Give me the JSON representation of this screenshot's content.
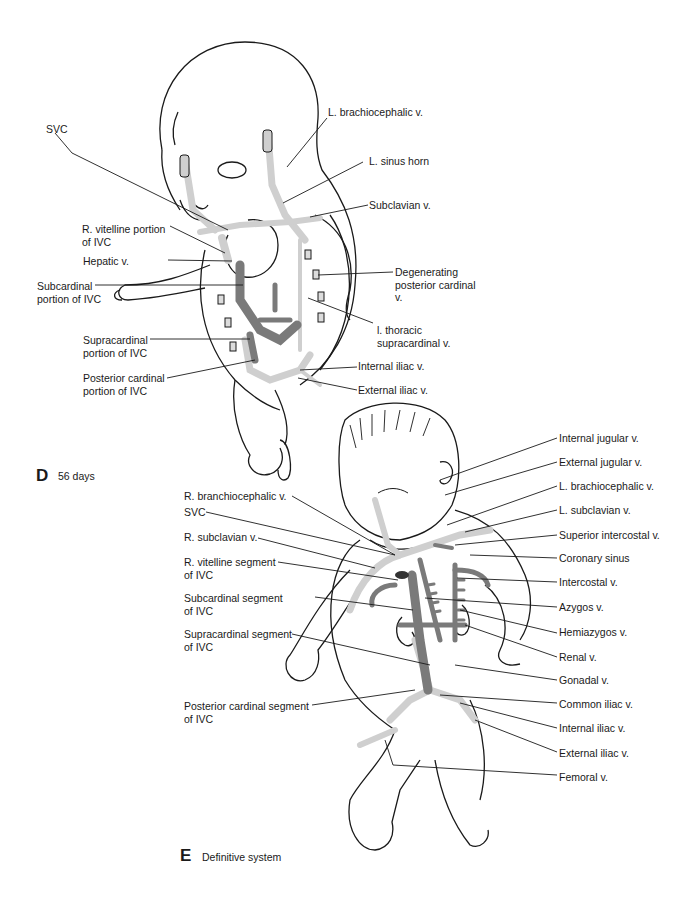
{
  "figure": {
    "panels": [
      {
        "id": "D",
        "letter": "D",
        "caption": "56 days",
        "labels_left": [
          {
            "text": "SVC"
          },
          {
            "text": "R. vitelline portion",
            "text2": "of IVC"
          },
          {
            "text": "Hepatic v."
          },
          {
            "text": "Subcardinal",
            "text2": "portion of IVC"
          },
          {
            "text": "Supracardinal",
            "text2": "portion of IVC"
          },
          {
            "text": "Posterior cardinal",
            "text2": "portion of IVC"
          }
        ],
        "labels_right": [
          {
            "text": "L. brachiocephalic v."
          },
          {
            "text": "L. sinus horn"
          },
          {
            "text": "Subclavian v."
          },
          {
            "text": "Degenerating",
            "text2": "posterior cardinal",
            "text3": "v."
          },
          {
            "text": "l. thoracic",
            "text2": "supracardinal v."
          },
          {
            "text": "Internal iliac v."
          },
          {
            "text": "External iliac v."
          }
        ]
      },
      {
        "id": "E",
        "letter": "E",
        "caption": "Definitive system",
        "labels_left": [
          {
            "text": "R. branchiocephalic v."
          },
          {
            "text": "SVC"
          },
          {
            "text": "R. subclavian v."
          },
          {
            "text": "R. vitelline segment",
            "text2": "of IVC"
          },
          {
            "text": "Subcardinal segment",
            "text2": "of IVC"
          },
          {
            "text": "Supracardinal segment",
            "text2": "of IVC"
          },
          {
            "text": "Posterior cardinal segment",
            "text2": "of IVC"
          }
        ],
        "labels_right": [
          {
            "text": "Internal jugular v."
          },
          {
            "text": "External jugular v."
          },
          {
            "text": "L. brachiocephalic v."
          },
          {
            "text": "L. subclavian v."
          },
          {
            "text": "Superior intercostal v."
          },
          {
            "text": "Coronary sinus"
          },
          {
            "text": "Intercostal v."
          },
          {
            "text": "Azygos v."
          },
          {
            "text": "Hemiazygos v."
          },
          {
            "text": "Renal v."
          },
          {
            "text": "Gonadal v."
          },
          {
            "text": "Common iliac v."
          },
          {
            "text": "Internal iliac v."
          },
          {
            "text": "External iliac v."
          },
          {
            "text": "Femoral v."
          }
        ]
      }
    ],
    "colors": {
      "outline": "#1a1a1a",
      "vessel_light": "#cfcfcf",
      "vessel_dark": "#7a7a7a",
      "background": "#ffffff"
    }
  }
}
